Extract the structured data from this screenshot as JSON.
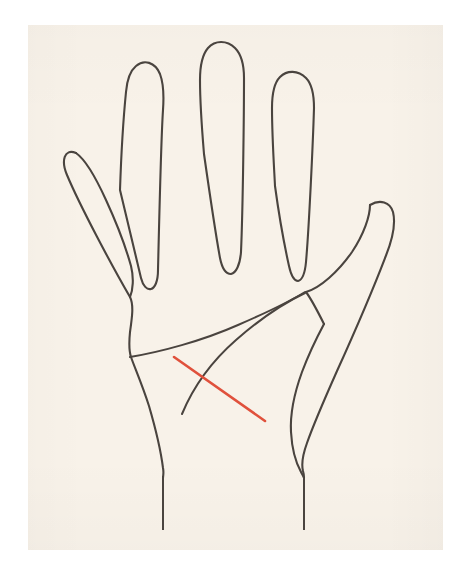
{
  "figure": {
    "caption": "",
    "view": "palmar"
  },
  "canvas": {
    "width": 471,
    "height": 576,
    "outer_background": "#ffffff"
  },
  "panel": {
    "x": 28,
    "y": 25,
    "width": 415,
    "height": 525,
    "background_color": "#f8f2e9",
    "border": "none"
  },
  "colors": {
    "paper": "#f8f2e9",
    "ink": "#4a443f",
    "highlight": "#e0513c",
    "page": "#ffffff"
  },
  "strokes": {
    "outline_width": 2.1,
    "palm_line_width": 2.0,
    "highlight_width": 2.6
  },
  "hand": {
    "label": "hand-outline",
    "digits": [
      {
        "name": "thumb",
        "tip_x": 390,
        "tip_y": 222
      },
      {
        "name": "index-finger",
        "tip_x": 153,
        "tip_y": 66
      },
      {
        "name": "middle-finger",
        "tip_x": 227,
        "tip_y": 45
      },
      {
        "name": "ring-finger",
        "tip_x": 296,
        "tip_y": 74
      },
      {
        "name": "little-finger",
        "tip_x": 76,
        "tip_y": 153
      }
    ],
    "outline_d": "M 76 153 C 66 150 63 160 68 172 C 78 196 108 258 129 296 C 133 303 131 314 129 330 C 128 342 128 352 130 357 L 130 357 C 133 363 141 380 148 404 C 155 428 160 450 163 466 C 164 472 163 476 163 479 M 137 66 C 146 61 156 64 160 74 C 163 82 163 96 162 108 C 160 140 158 228 157 270 C 157 280 154 287 150 288 C 146 289 143 284 141 276 C 137 260 126 212 120 190 M 207 46 C 216 40 228 41 236 48 C 242 54 244 64 244 76 C 244 110 243 204 241 252 C 240 264 236 272 231 273 C 226 273 222 266 220 256 C 216 234 208 180 204 154 M 280 76 C 288 70 299 71 306 78 C 312 84 314 94 314 106 C 313 142 308 228 305 262 C 304 272 301 279 297 280 C 293 280 290 274 288 265 C 284 246 278 206 275 186 M 368 206 C 378 200 388 202 391 212 C 394 222 391 238 385 256 C 374 290 352 340 338 370 C 325 398 314 424 306 444 C 302 454 300 462 302 470 L 302 474 M 323 325 C 317 337 311 350 307 362 C 300 380 296 398 296 414 C 296 430 299 444 302 452",
    "palm_contour_right_d": "M 305 293 C 298 305 292 320 289 336 C 286 354 286 372 289 390 C 292 408 296 424 302 438 C 306 448 306 456 304 464"
  },
  "palm_lines": [
    {
      "id": "heart-line",
      "label": "heart line",
      "color": "#4a443f",
      "d": "M 130 357 C 160 352 202 341 238 325 C 268 312 292 300 305 292",
      "start": [
        130,
        357
      ],
      "end": [
        305,
        292
      ]
    },
    {
      "id": "head-line",
      "label": "head line",
      "color": "#4a443f",
      "d": "M 305 293 C 286 302 260 319 236 340 C 212 361 194 385 182 414",
      "start": [
        305,
        293
      ],
      "end": [
        182,
        414
      ]
    }
  ],
  "highlighted_line": {
    "id": "marked-line",
    "label": "marked line",
    "color": "#e0513c",
    "d": "M 174 357 L 265 421",
    "start": [
      174,
      357
    ],
    "end": [
      265,
      421
    ],
    "note": "red diagonal crossing the head line"
  },
  "wrist_lines": [
    {
      "id": "wrist-line-left",
      "x": 163,
      "y1": 476,
      "y2": 530
    },
    {
      "id": "wrist-line-right",
      "x": 304,
      "y1": 478,
      "y2": 530
    }
  ],
  "annotations": []
}
